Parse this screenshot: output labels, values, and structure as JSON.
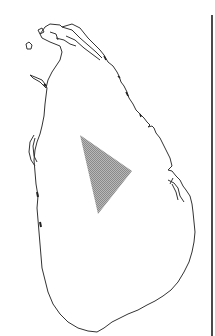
{
  "map": {
    "subject": "Sri Lanka island outline",
    "outline_color": "#333333",
    "background": "#ffffff",
    "highlight": {
      "shape": "triangle",
      "fill": "#9e9e9e",
      "pattern": "stippled-gray",
      "vertices": [
        [
          80,
          135
        ],
        [
          132,
          171
        ],
        [
          98,
          214
        ]
      ]
    },
    "frame_line": {
      "side": "right",
      "color": "#4a4a4a"
    }
  }
}
